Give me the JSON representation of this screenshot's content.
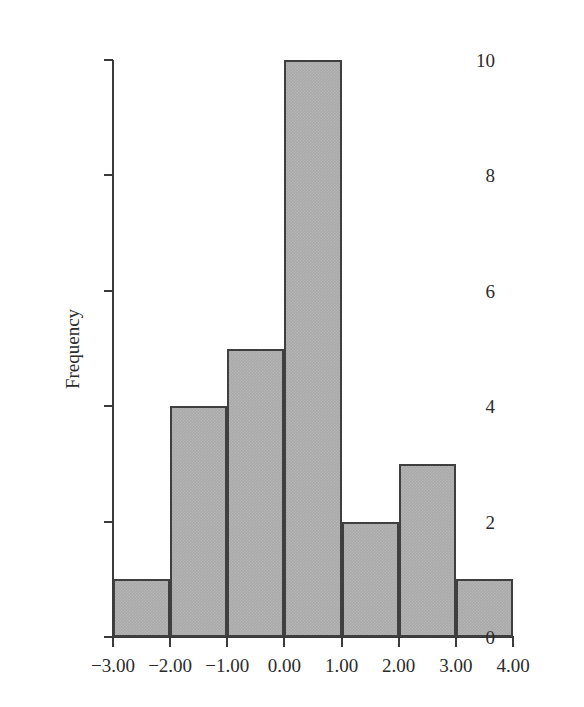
{
  "chart_data": {
    "type": "bar",
    "title": "",
    "subtitle": "",
    "xlabel": "",
    "ylabel": "Frequency",
    "grid": false,
    "legend": null,
    "xlim": [
      -3.0,
      4.0
    ],
    "ylim": [
      0,
      10
    ],
    "bin_width": 1.0,
    "bin_edges": [
      -3.0,
      -2.0,
      -1.0,
      0.0,
      1.0,
      2.0,
      3.0,
      4.0
    ],
    "categories": [
      "-3.00 to -2.00",
      "-2.00 to -1.00",
      "-1.00 to 0.00",
      "0.00 to 1.00",
      "1.00 to 2.00",
      "2.00 to 3.00",
      "3.00 to 4.00"
    ],
    "values": [
      1,
      4,
      5,
      10,
      2,
      3,
      1
    ],
    "total_count": 26,
    "bar_fill_color": "#a9a9a9",
    "bar_edge_color": "#3f3f3f",
    "axis_color": "#3a3a3a",
    "background_color": "#ffffff",
    "x_tick_values": [
      -3.0,
      -2.0,
      -1.0,
      0.0,
      1.0,
      2.0,
      3.0,
      4.0
    ],
    "x_tick_labels": [
      "−3.00",
      "−2.00",
      "−1.00",
      "0.00",
      "1.00",
      "2.00",
      "3.00",
      "4.00"
    ],
    "y_tick_values": [
      0,
      2,
      4,
      6,
      8,
      10
    ],
    "y_tick_labels": [
      "0",
      "2",
      "4",
      "6",
      "8",
      "10"
    ]
  }
}
